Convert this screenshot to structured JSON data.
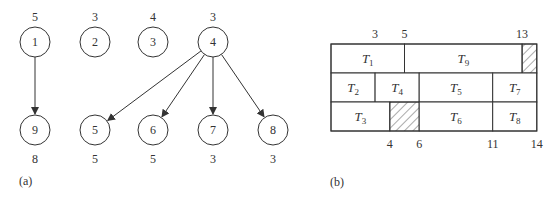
{
  "panel_a": {
    "caption": "(a)",
    "nodes": [
      {
        "id": "1",
        "label": "1",
        "weight": "5",
        "cx": 35,
        "cy": 42
      },
      {
        "id": "2",
        "label": "2",
        "weight": "3",
        "cx": 95,
        "cy": 42
      },
      {
        "id": "3",
        "label": "3",
        "weight": "4",
        "cx": 153,
        "cy": 42
      },
      {
        "id": "4",
        "label": "4",
        "weight": "3",
        "cx": 213,
        "cy": 42
      },
      {
        "id": "9",
        "label": "9",
        "weight": "8",
        "cx": 35,
        "cy": 130
      },
      {
        "id": "5",
        "label": "5",
        "weight": "5",
        "cx": 95,
        "cy": 130
      },
      {
        "id": "6",
        "label": "6",
        "weight": "5",
        "cx": 153,
        "cy": 130
      },
      {
        "id": "7",
        "label": "7",
        "weight": "3",
        "cx": 213,
        "cy": 130
      },
      {
        "id": "8",
        "label": "8",
        "weight": "3",
        "cx": 273,
        "cy": 130
      }
    ],
    "edges": [
      {
        "from": "1",
        "to": "9"
      },
      {
        "from": "4",
        "to": "5"
      },
      {
        "from": "4",
        "to": "6"
      },
      {
        "from": "4",
        "to": "7"
      },
      {
        "from": "4",
        "to": "8"
      }
    ]
  },
  "panel_b": {
    "caption": "(b)",
    "gantt": {
      "x0": 331,
      "y0": 44,
      "unit_px": 14.7,
      "row_h": 29,
      "total_time": 14,
      "rows": [
        [
          {
            "task": "T",
            "sub": "1",
            "start": 0,
            "end": 5
          },
          {
            "task": "T",
            "sub": "9",
            "start": 5,
            "end": 13
          },
          {
            "idle": true,
            "start": 13,
            "end": 14
          }
        ],
        [
          {
            "task": "T",
            "sub": "2",
            "start": 0,
            "end": 3
          },
          {
            "task": "T",
            "sub": "4",
            "start": 3,
            "end": 6
          },
          {
            "task": "T",
            "sub": "5",
            "start": 6,
            "end": 11
          },
          {
            "task": "T",
            "sub": "7",
            "start": 11,
            "end": 14
          }
        ],
        [
          {
            "task": "T",
            "sub": "3",
            "start": 0,
            "end": 4
          },
          {
            "idle": true,
            "start": 4,
            "end": 6
          },
          {
            "task": "T",
            "sub": "6",
            "start": 6,
            "end": 11
          },
          {
            "task": "T",
            "sub": "8",
            "start": 11,
            "end": 14
          }
        ]
      ],
      "top_ticks": [
        {
          "label": "3",
          "t": 3
        },
        {
          "label": "5",
          "t": 5
        },
        {
          "label": "13",
          "t": 13
        }
      ],
      "bottom_ticks": [
        {
          "label": "4",
          "t": 4
        },
        {
          "label": "6",
          "t": 6
        },
        {
          "label": "11",
          "t": 11
        },
        {
          "label": "14",
          "t": 14
        }
      ]
    }
  }
}
